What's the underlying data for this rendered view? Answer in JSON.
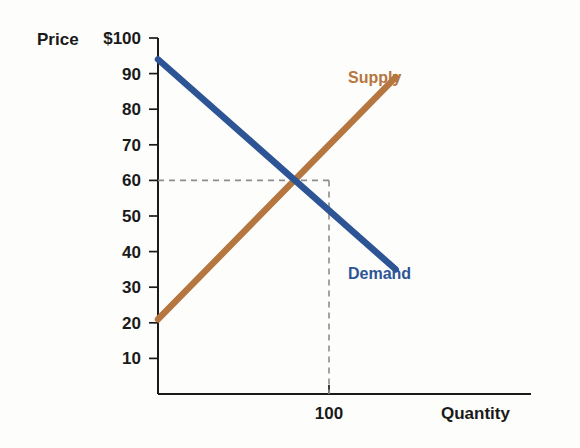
{
  "chart_data": {
    "type": "line",
    "title": "",
    "xlabel": "Quantity",
    "ylabel": "Price",
    "y_axis_prefix": "$",
    "ylim": [
      0,
      100
    ],
    "xlim": [
      0,
      160
    ],
    "grid": false,
    "legend_position": "inline-right",
    "y_ticks": [
      {
        "value": 100,
        "label": "$100"
      },
      {
        "value": 90,
        "label": "90"
      },
      {
        "value": 80,
        "label": "80"
      },
      {
        "value": 70,
        "label": "70"
      },
      {
        "value": 60,
        "label": "60"
      },
      {
        "value": 50,
        "label": "50"
      },
      {
        "value": 40,
        "label": "40"
      },
      {
        "value": 30,
        "label": "30"
      },
      {
        "value": 20,
        "label": "20"
      },
      {
        "value": 10,
        "label": "10"
      }
    ],
    "x_ticks": [
      {
        "value": 100,
        "label": "100"
      }
    ],
    "series": [
      {
        "name": "Supply",
        "color": "#b5763f",
        "label_x": 100,
        "label_y": 89,
        "points": [
          {
            "x": 0,
            "y": 21
          },
          {
            "x": 139,
            "y": 89
          }
        ]
      },
      {
        "name": "Demand",
        "color": "#2d5596",
        "label_x": 100,
        "label_y": 34,
        "points": [
          {
            "x": 0,
            "y": 94
          },
          {
            "x": 139,
            "y": 35
          }
        ]
      }
    ],
    "equilibrium": {
      "quantity": 100,
      "price": 60,
      "guide_style": "dashed",
      "guide_color": "#8d8d8d"
    },
    "annotations": []
  }
}
